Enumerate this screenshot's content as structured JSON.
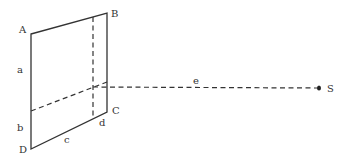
{
  "diagram": {
    "type": "geometry",
    "vertices": {
      "A": "A",
      "B": "B",
      "C": "C",
      "D": "D"
    },
    "segment_labels": {
      "a": "a",
      "b": "b",
      "c": "c",
      "d": "d",
      "e": "e"
    },
    "point_S": "S"
  }
}
